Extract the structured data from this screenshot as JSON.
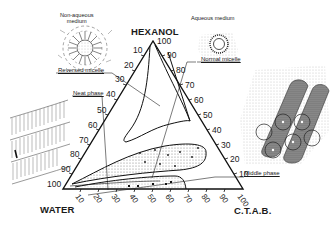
{
  "diagram": {
    "type": "ternary-phase-diagram",
    "vertices": {
      "top": "HEXANOL",
      "bottom_left": "WATER",
      "bottom_right": "C.T.A.B."
    },
    "axes": {
      "left_edge_ticks": [
        "10",
        "20",
        "30",
        "40",
        "50",
        "60",
        "70",
        "80",
        "90",
        "100"
      ],
      "right_edge_ticks": [
        "100",
        "90",
        "80",
        "70",
        "60",
        "50",
        "40",
        "30",
        "20",
        "10"
      ],
      "bottom_edge_ticks": [
        "10",
        "20",
        "30",
        "40",
        "50",
        "60",
        "70",
        "80",
        "90",
        "100"
      ]
    },
    "regions": [
      {
        "name": "Reversed micelle",
        "caption": "Reversed micelle"
      },
      {
        "name": "Normal micelle",
        "caption": "Normal micelle"
      },
      {
        "name": "Neat phase",
        "caption": "Neat phase"
      },
      {
        "name": "Middle phase",
        "caption": "Middle phase"
      }
    ],
    "illustrations": {
      "non_aqueous": {
        "line1": "Non-aqueous",
        "line2": "medium"
      },
      "aqueous": {
        "label": "Aqueous medium"
      }
    },
    "colors": {
      "ink": "#1a1a1a",
      "background": "#ffffff",
      "stipple": "#555555"
    }
  }
}
